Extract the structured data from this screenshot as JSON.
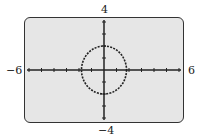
{
  "chart_data": {
    "type": "line",
    "title": "",
    "xlabel": "",
    "ylabel": "",
    "xlim": [
      -6,
      6
    ],
    "ylim": [
      -4,
      4
    ],
    "xscale": 1,
    "yscale": 1,
    "grid": false,
    "tick_labels": {
      "x_min": "−6",
      "x_max": "6",
      "y_min": "−4",
      "y_max": "4"
    },
    "series": [
      {
        "name": "circle",
        "equation": "x^2 + y^2 = 4",
        "center": [
          0,
          0
        ],
        "radius": 2,
        "style": "dotted"
      }
    ]
  },
  "labels": {
    "x_min": "−6",
    "x_max": "6",
    "y_min": "−4",
    "y_max": "4"
  }
}
